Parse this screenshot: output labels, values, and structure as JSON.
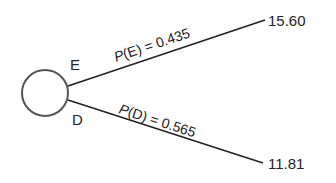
{
  "diagram": {
    "type": "decision-tree",
    "node": {
      "shape": "circle",
      "kind": "chance-node"
    },
    "branches": [
      {
        "event": "E",
        "probability_label": "P(E) = 0.435",
        "probability": 0.435,
        "payoff": "15.60"
      },
      {
        "event": "D",
        "probability_label": "P(D) = 0.565",
        "probability": 0.565,
        "payoff": "11.81"
      }
    ]
  },
  "colors": {
    "stroke": "#333333",
    "text": "#222222",
    "background": "#ffffff"
  }
}
